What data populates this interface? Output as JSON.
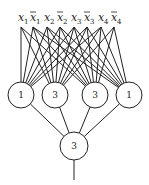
{
  "diagram": {
    "type": "threshold-network",
    "inputs": [
      {
        "id": "x1",
        "var": "x",
        "sub": "1",
        "negated": false,
        "x": 21
      },
      {
        "id": "nx1",
        "var": "x",
        "sub": "1",
        "negated": true,
        "x": 33
      },
      {
        "id": "x2",
        "var": "x",
        "sub": "2",
        "negated": false,
        "x": 47
      },
      {
        "id": "nx2",
        "var": "x",
        "sub": "2",
        "negated": true,
        "x": 60
      },
      {
        "id": "x3",
        "var": "x",
        "sub": "3",
        "negated": false,
        "x": 74
      },
      {
        "id": "nx3",
        "var": "x",
        "sub": "3",
        "negated": true,
        "x": 87
      },
      {
        "id": "x4",
        "var": "x",
        "sub": "4",
        "negated": false,
        "x": 101
      },
      {
        "id": "nx4",
        "var": "x",
        "sub": "4",
        "negated": true,
        "x": 114
      }
    ],
    "hidden_nodes": [
      {
        "id": "h1",
        "label": "1",
        "cx": 21,
        "cy": 95,
        "inputs": [
          "x1",
          "nx1",
          "x2",
          "nx2",
          "x3",
          "nx3",
          "x4"
        ]
      },
      {
        "id": "h2",
        "label": "3",
        "cx": 55,
        "cy": 95,
        "inputs": [
          "x1",
          "nx1",
          "x2",
          "nx2",
          "x3",
          "nx3",
          "x4",
          "nx4"
        ]
      },
      {
        "id": "h3",
        "label": "3",
        "cx": 95,
        "cy": 95,
        "inputs": [
          "x1",
          "nx1",
          "x2",
          "nx2",
          "x3",
          "nx3",
          "x4",
          "nx4"
        ]
      },
      {
        "id": "h4",
        "label": "1",
        "cx": 129,
        "cy": 95,
        "inputs": [
          "nx1",
          "x2",
          "nx2",
          "x3",
          "nx3",
          "x4",
          "nx4"
        ]
      }
    ],
    "output_node": {
      "id": "out",
      "label": "3",
      "cx": 74,
      "cy": 146
    }
  }
}
